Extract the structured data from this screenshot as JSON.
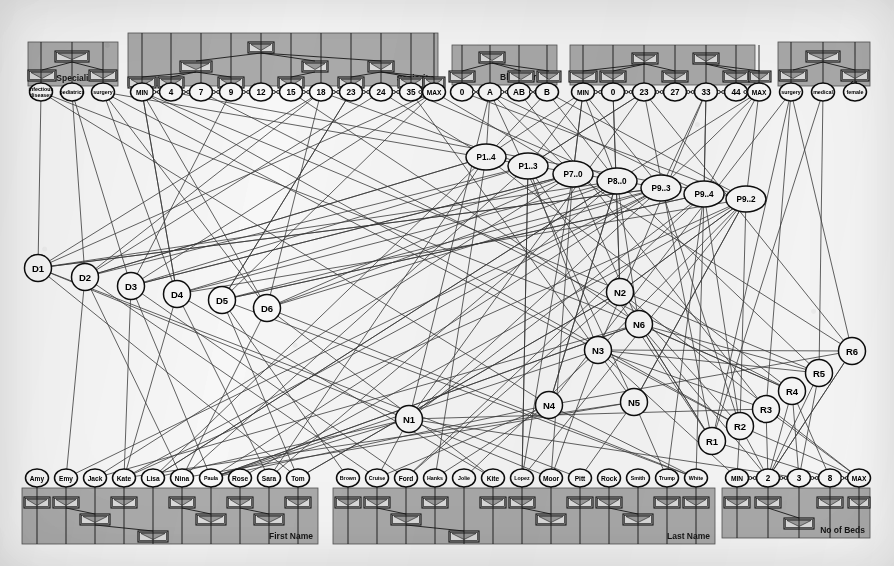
{
  "figure": {
    "kind": "attribute-hierarchy-graph",
    "background_color": "#f3f2ee",
    "panel_color": "#a9a9a9",
    "node_fill": "#f4f3ef",
    "edge_color": "#3a3a3a"
  },
  "panels": [
    {
      "id": "specialization",
      "title": "Specialization",
      "x": 28,
      "y": 42,
      "w": 90,
      "h": 44,
      "leaf_y": 92,
      "leaves": [
        {
          "label": "infectious\ndiseases",
          "x": 41
        },
        {
          "label": "pediatrics",
          "x": 72
        },
        {
          "label": "surgery",
          "x": 103
        }
      ],
      "hierarchy_boxes": [
        {
          "label": "specialization",
          "x": 72,
          "y": 51,
          "w": 34
        },
        {
          "label": "internal",
          "x": 42,
          "y": 70,
          "w": 28
        },
        {
          "label": "surgical",
          "x": 103,
          "y": 70,
          "w": 28
        }
      ]
    },
    {
      "id": "seniority",
      "title": "Seniority",
      "x": 128,
      "y": 33,
      "w": 310,
      "h": 53,
      "leaf_y": 92,
      "leaves": [
        {
          "label": "MIN",
          "x": 142
        },
        {
          "label": "4",
          "x": 171
        },
        {
          "label": "7",
          "x": 201
        },
        {
          "label": "9",
          "x": 231
        },
        {
          "label": "12",
          "x": 261
        },
        {
          "label": "15",
          "x": 291
        },
        {
          "label": "18",
          "x": 321
        },
        {
          "label": "23",
          "x": 351
        },
        {
          "label": "24",
          "x": 381
        },
        {
          "label": "35",
          "x": 411
        },
        {
          "label": "MAX",
          "x": 434
        }
      ],
      "hierarchy_boxes": [
        {
          "label": "12",
          "x": 261,
          "y": 42,
          "w": 26
        },
        {
          "label": "7",
          "x": 196,
          "y": 61,
          "w": 32
        },
        {
          "label": "18",
          "x": 315,
          "y": 61,
          "w": 26
        },
        {
          "label": "24",
          "x": 381,
          "y": 61,
          "w": 26
        },
        {
          "label": "MIN",
          "x": 142,
          "y": 77,
          "w": 28
        },
        {
          "label": "4",
          "x": 171,
          "y": 77,
          "w": 26
        },
        {
          "label": "9",
          "x": 231,
          "y": 77,
          "w": 26
        },
        {
          "label": "15",
          "x": 291,
          "y": 77,
          "w": 26
        },
        {
          "label": "23",
          "x": 351,
          "y": 77,
          "w": 26
        },
        {
          "label": "35",
          "x": 411,
          "y": 77,
          "w": 26
        },
        {
          "label": "MAX",
          "x": 434,
          "y": 77,
          "w": 22
        }
      ]
    },
    {
      "id": "blood-group",
      "title": "Blood Group",
      "x": 452,
      "y": 45,
      "w": 105,
      "h": 40,
      "leaf_y": 92,
      "leaves": [
        {
          "label": "0",
          "x": 462
        },
        {
          "label": "A",
          "x": 490
        },
        {
          "label": "AB",
          "x": 519
        },
        {
          "label": "B",
          "x": 547
        }
      ],
      "hierarchy_boxes": [
        {
          "label": "A",
          "x": 492,
          "y": 52,
          "w": 26
        },
        {
          "label": "0",
          "x": 462,
          "y": 71,
          "w": 26
        },
        {
          "label": "AB",
          "x": 521,
          "y": 71,
          "w": 26
        },
        {
          "label": "B",
          "x": 549,
          "y": 71,
          "w": 24
        }
      ]
    },
    {
      "id": "age",
      "title": "Age",
      "x": 570,
      "y": 45,
      "w": 185,
      "h": 40,
      "leaf_y": 92,
      "leaves": [
        {
          "label": "MIN",
          "x": 583
        },
        {
          "label": "0",
          "x": 613
        },
        {
          "label": "23",
          "x": 644
        },
        {
          "label": "27",
          "x": 675
        },
        {
          "label": "33",
          "x": 706
        },
        {
          "label": "44",
          "x": 736
        },
        {
          "label": "MAX",
          "x": 759
        }
      ],
      "hierarchy_boxes": [
        {
          "label": "23",
          "x": 645,
          "y": 53,
          "w": 26
        },
        {
          "label": "33",
          "x": 706,
          "y": 53,
          "w": 26
        },
        {
          "label": "MIN",
          "x": 583,
          "y": 71,
          "w": 28
        },
        {
          "label": "0",
          "x": 613,
          "y": 71,
          "w": 26
        },
        {
          "label": "27",
          "x": 675,
          "y": 71,
          "w": 26
        },
        {
          "label": "44",
          "x": 736,
          "y": 71,
          "w": 26
        },
        {
          "label": "MAX",
          "x": 760,
          "y": 71,
          "w": 22
        }
      ]
    },
    {
      "id": "type",
      "title": "Type",
      "x": 778,
      "y": 42,
      "w": 92,
      "h": 44,
      "leaf_y": 92,
      "leaves": [
        {
          "label": "surgery",
          "x": 791
        },
        {
          "label": "medical",
          "x": 823
        },
        {
          "label": "female",
          "x": 855
        }
      ],
      "hierarchy_boxes": [
        {
          "label": "type",
          "x": 823,
          "y": 51,
          "w": 34
        },
        {
          "label": "surg",
          "x": 793,
          "y": 70,
          "w": 28
        },
        {
          "label": "med",
          "x": 855,
          "y": 70,
          "w": 28
        }
      ]
    },
    {
      "id": "first-name",
      "title": "First Name",
      "x": 22,
      "y": 488,
      "w": 296,
      "h": 56,
      "leaf_y": 478,
      "leaves": [
        {
          "label": "Amy",
          "x": 37
        },
        {
          "label": "Emy",
          "x": 66
        },
        {
          "label": "Jack",
          "x": 95
        },
        {
          "label": "Kate",
          "x": 124
        },
        {
          "label": "Lisa",
          "x": 153
        },
        {
          "label": "Nina",
          "x": 182
        },
        {
          "label": "Paula",
          "x": 211
        },
        {
          "label": "Rose",
          "x": 240
        },
        {
          "label": "Sara",
          "x": 269
        },
        {
          "label": "Tom",
          "x": 298
        }
      ],
      "hierarchy_boxes": [
        {
          "label": "Amy",
          "x": 37,
          "y": 497,
          "w": 26
        },
        {
          "label": "Emy",
          "x": 66,
          "y": 497,
          "w": 26
        },
        {
          "label": "Kate",
          "x": 124,
          "y": 497,
          "w": 26
        },
        {
          "label": "Nina",
          "x": 182,
          "y": 497,
          "w": 26
        },
        {
          "label": "Rose",
          "x": 240,
          "y": 497,
          "w": 26
        },
        {
          "label": "Tom",
          "x": 298,
          "y": 497,
          "w": 26
        },
        {
          "label": "Jack",
          "x": 95,
          "y": 514,
          "w": 30
        },
        {
          "label": "Paula",
          "x": 211,
          "y": 514,
          "w": 30
        },
        {
          "label": "Sara",
          "x": 269,
          "y": 514,
          "w": 30
        },
        {
          "label": "Lisa",
          "x": 153,
          "y": 531,
          "w": 30
        }
      ]
    },
    {
      "id": "last-name",
      "title": "Last Name",
      "x": 333,
      "y": 488,
      "w": 382,
      "h": 56,
      "leaf_y": 478,
      "leaves": [
        {
          "label": "Brown",
          "x": 348
        },
        {
          "label": "Cruise",
          "x": 377
        },
        {
          "label": "Ford",
          "x": 406
        },
        {
          "label": "Hanks",
          "x": 435
        },
        {
          "label": "Jolie",
          "x": 464
        },
        {
          "label": "Kite",
          "x": 493
        },
        {
          "label": "Lopez",
          "x": 522
        },
        {
          "label": "Moor",
          "x": 551
        },
        {
          "label": "Pitt",
          "x": 580
        },
        {
          "label": "Rock",
          "x": 609
        },
        {
          "label": "Smith",
          "x": 638
        },
        {
          "label": "Trump",
          "x": 667
        },
        {
          "label": "White",
          "x": 696
        }
      ],
      "hierarchy_boxes": [
        {
          "label": "Brown",
          "x": 348,
          "y": 497,
          "w": 26
        },
        {
          "label": "Cruise",
          "x": 377,
          "y": 497,
          "w": 26
        },
        {
          "label": "Hanks",
          "x": 435,
          "y": 497,
          "w": 26
        },
        {
          "label": "Kite",
          "x": 493,
          "y": 497,
          "w": 26
        },
        {
          "label": "Lopez",
          "x": 522,
          "y": 497,
          "w": 26
        },
        {
          "label": "Pitt",
          "x": 580,
          "y": 497,
          "w": 26
        },
        {
          "label": "Rock",
          "x": 609,
          "y": 497,
          "w": 26
        },
        {
          "label": "Trump",
          "x": 667,
          "y": 497,
          "w": 26
        },
        {
          "label": "White",
          "x": 696,
          "y": 497,
          "w": 26
        },
        {
          "label": "Ford",
          "x": 406,
          "y": 514,
          "w": 30
        },
        {
          "label": "Moor",
          "x": 551,
          "y": 514,
          "w": 30
        },
        {
          "label": "Smith",
          "x": 638,
          "y": 514,
          "w": 30
        },
        {
          "label": "Jolie",
          "x": 464,
          "y": 531,
          "w": 30
        }
      ]
    },
    {
      "id": "no-of-beds",
      "title": "No of Beds",
      "x": 722,
      "y": 488,
      "w": 148,
      "h": 50,
      "leaf_y": 478,
      "leaves": [
        {
          "label": "MIN",
          "x": 737
        },
        {
          "label": "2",
          "x": 768
        },
        {
          "label": "3",
          "x": 799
        },
        {
          "label": "8",
          "x": 830
        },
        {
          "label": "MAX",
          "x": 859
        }
      ],
      "hierarchy_boxes": [
        {
          "label": "MIN",
          "x": 737,
          "y": 497,
          "w": 26
        },
        {
          "label": "2",
          "x": 768,
          "y": 497,
          "w": 26
        },
        {
          "label": "8",
          "x": 830,
          "y": 497,
          "w": 26
        },
        {
          "label": "MAX",
          "x": 859,
          "y": 497,
          "w": 22
        },
        {
          "label": "3",
          "x": 799,
          "y": 518,
          "w": 30
        }
      ]
    }
  ],
  "graph_nodes": {
    "doctors": [
      {
        "label": "D1",
        "x": 38,
        "y": 268
      },
      {
        "label": "D2",
        "x": 85,
        "y": 277
      },
      {
        "label": "D3",
        "x": 131,
        "y": 286
      },
      {
        "label": "D4",
        "x": 177,
        "y": 294
      },
      {
        "label": "D5",
        "x": 222,
        "y": 300
      },
      {
        "label": "D6",
        "x": 267,
        "y": 308
      }
    ],
    "patients": [
      {
        "label": "P1..4",
        "x": 486,
        "y": 157
      },
      {
        "label": "P1..3",
        "x": 528,
        "y": 166
      },
      {
        "label": "P7..0",
        "x": 573,
        "y": 174
      },
      {
        "label": "P8..0",
        "x": 617,
        "y": 181
      },
      {
        "label": "P9..3",
        "x": 661,
        "y": 188
      },
      {
        "label": "P9..4",
        "x": 704,
        "y": 194
      },
      {
        "label": "P9..2",
        "x": 746,
        "y": 199
      }
    ],
    "nurses": [
      {
        "label": "N1",
        "x": 409,
        "y": 419
      },
      {
        "label": "N2",
        "x": 620,
        "y": 292
      },
      {
        "label": "N3",
        "x": 598,
        "y": 350
      },
      {
        "label": "N4",
        "x": 549,
        "y": 405
      },
      {
        "label": "N5",
        "x": 634,
        "y": 402
      },
      {
        "label": "N6",
        "x": 639,
        "y": 324
      }
    ],
    "rooms": [
      {
        "label": "R1",
        "x": 712,
        "y": 441
      },
      {
        "label": "R2",
        "x": 740,
        "y": 426
      },
      {
        "label": "R3",
        "x": 766,
        "y": 409
      },
      {
        "label": "R4",
        "x": 792,
        "y": 391
      },
      {
        "label": "R5",
        "x": 819,
        "y": 373
      },
      {
        "label": "R6",
        "x": 852,
        "y": 351
      }
    ]
  }
}
